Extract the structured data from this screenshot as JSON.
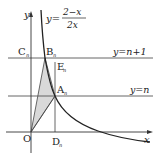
{
  "diagram": {
    "curve_equation": {
      "prefix": "y=",
      "numerator": "2−x",
      "denominator": "2x"
    },
    "axes": {
      "x_label": "x",
      "y_label": "y",
      "origin_label": "O"
    },
    "lines": {
      "upper": "y=n+1",
      "lower": "y=n"
    },
    "points": {
      "C": {
        "letter": "C",
        "sub": "n"
      },
      "B": {
        "letter": "B",
        "sub": "n"
      },
      "E": {
        "letter": "E",
        "sub": "n"
      },
      "A": {
        "letter": "A",
        "sub": "n"
      },
      "D": {
        "letter": "D",
        "sub": "n"
      }
    },
    "colors": {
      "stroke": "#222222",
      "thin": "#555555",
      "shade": "#d9d9d9"
    }
  }
}
